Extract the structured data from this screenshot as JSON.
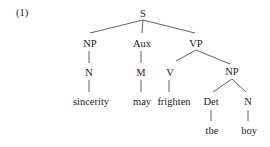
{
  "example_number": "(1)",
  "tree": {
    "root": "S",
    "nodes": {
      "s": "S",
      "np_subj": "NP",
      "aux": "Aux",
      "vp": "VP",
      "n_subj": "N",
      "m": "M",
      "v": "V",
      "np_obj": "NP",
      "det": "Det",
      "n_obj": "N"
    },
    "leaves": {
      "sincerity": "sincerity",
      "may": "may",
      "frighten": "frighten",
      "the": "the",
      "boy": "boy"
    },
    "bracketed": "[S [NP [N sincerity]] [Aux [M may]] [VP [V frighten] [NP [Det the] [N boy]]]]"
  }
}
